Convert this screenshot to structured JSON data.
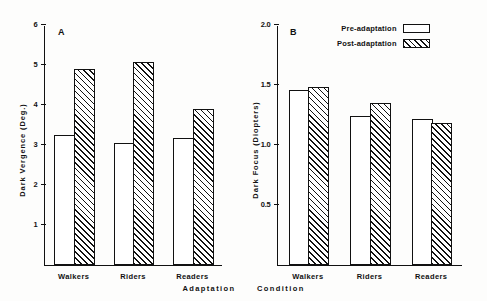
{
  "figure": {
    "axis_caption_primary": "Adaptation",
    "axis_caption_secondary": "Condition"
  },
  "legend": {
    "position": "top-right of panel B",
    "items": [
      {
        "label": "Pre-adaptation",
        "swatch": "open-rectangle"
      },
      {
        "label": "Post-adaptation",
        "swatch": "hatched-rectangle"
      }
    ]
  },
  "chart_data": [
    {
      "type": "bar",
      "panel": "A",
      "title": "",
      "xlabel": "Adaptation Condition",
      "ylabel": "Dark Vergence (Deg.)",
      "ylim": [
        0,
        6
      ],
      "yticks": [
        1,
        2,
        3,
        4,
        5,
        6
      ],
      "ytick_labels": [
        "1",
        "2",
        "3",
        "4",
        "5",
        "6"
      ],
      "grid": false,
      "categories": [
        "Walkers",
        "Riders",
        "Readers"
      ],
      "series": [
        {
          "name": "Pre-adaptation",
          "values": [
            3.25,
            3.05,
            3.18
          ]
        },
        {
          "name": "Post-adaptation",
          "values": [
            4.9,
            5.08,
            3.9
          ]
        }
      ]
    },
    {
      "type": "bar",
      "panel": "B",
      "title": "",
      "xlabel": "Adaptation Condition",
      "ylabel": "Dark Focus (Diopters)",
      "ylim": [
        0,
        2.0
      ],
      "yticks": [
        0.5,
        1.0,
        1.5,
        2.0
      ],
      "ytick_labels": [
        "0.5",
        "1.0",
        "1.5",
        "2.0"
      ],
      "grid": false,
      "categories": [
        "Walkers",
        "Riders",
        "Readers"
      ],
      "series": [
        {
          "name": "Pre-adaptation",
          "values": [
            1.46,
            1.24,
            1.22
          ]
        },
        {
          "name": "Post-adaptation",
          "values": [
            1.48,
            1.35,
            1.18
          ]
        }
      ]
    }
  ],
  "panel_a": {
    "letter": "A",
    "ylabel": "Dark Vergence (Deg.)",
    "ytick_labels": [
      "1",
      "2",
      "3",
      "4",
      "5",
      "6"
    ],
    "categories": [
      "Walkers",
      "Riders",
      "Readers"
    ]
  },
  "panel_b": {
    "letter": "B",
    "ylabel": "Dark Focus (Diopters)",
    "ytick_labels": [
      "0.5",
      "1.0",
      "1.5",
      "2.0"
    ],
    "categories": [
      "Walkers",
      "Riders",
      "Readers"
    ]
  },
  "colors": {
    "ink": "#111111",
    "paper": "#fdfdfc"
  }
}
